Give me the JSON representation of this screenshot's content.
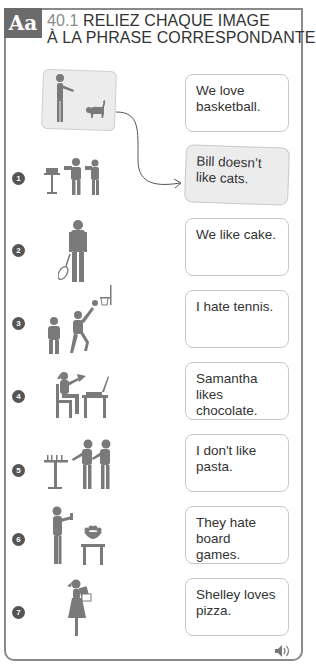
{
  "header": {
    "badge": "Aa",
    "exercise_number": "40.1",
    "title_line1": "RELIEZ CHAQUE IMAGE",
    "title_line2": "À LA PHRASE CORRESPONDANTE."
  },
  "example": {
    "image": "man-with-cat",
    "answer_index": 1
  },
  "items": [
    {
      "number": "1",
      "image": "people-with-cake"
    },
    {
      "number": "2",
      "image": "man-with-tennis-racket"
    },
    {
      "number": "3",
      "image": "basketball-players"
    },
    {
      "number": "4",
      "image": "girl-eating-pizza-at-laptop"
    },
    {
      "number": "5",
      "image": "people-near-board-game"
    },
    {
      "number": "6",
      "image": "man-refusing-pasta"
    },
    {
      "number": "7",
      "image": "girl-with-chocolate"
    }
  ],
  "sentences": [
    {
      "text": "We love basketball."
    },
    {
      "text": "Bill doesn’t like cats."
    },
    {
      "text": "We like cake."
    },
    {
      "text": "I hate tennis."
    },
    {
      "text": "Samantha likes chocolate."
    },
    {
      "text": "I don't like pasta."
    },
    {
      "text": "They hate board games."
    },
    {
      "text": "Shelley loves pizza."
    }
  ],
  "audio": {
    "icon": "speaker-icon"
  },
  "colors": {
    "badge": "#6b6b6b",
    "border": "#8a8a8a",
    "figure": "#7a7a7a",
    "filled_box": "#ececec"
  }
}
